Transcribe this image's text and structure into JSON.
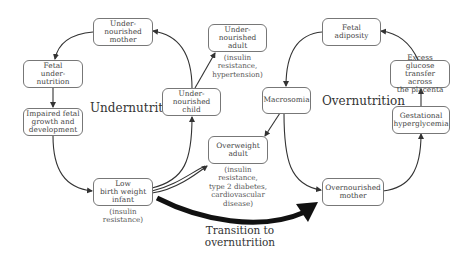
{
  "diagram": {
    "cycles": {
      "undernutrition": {
        "label": "Undernutrition"
      },
      "overnutrition": {
        "label": "Overnutrition"
      }
    },
    "transition": {
      "label": "Transition to\novernutrition"
    },
    "nodes": {
      "undernourished_mother": {
        "label": "Under-\nnourished\nmother"
      },
      "fetal_undernutrition": {
        "label": "Fetal\nunder-\nnutrition"
      },
      "impaired_growth": {
        "label": "Impaired fetal\ngrowth and\ndevelopment"
      },
      "low_birth_weight": {
        "label": "Low\nbirth weight\ninfant",
        "note": "(insulin\nresistance)"
      },
      "undernourished_child": {
        "label": "Under-\nnourished\nchild"
      },
      "undernourished_adult": {
        "label": "Under-\nnourished\nadult",
        "note": "(insulin\nresistance,\nhypertension)"
      },
      "overweight_adult": {
        "label": "Overweight\nadult",
        "note": "(insulin\nresistance,\ntype 2 diabetes,\ncardiovascular\ndisease)"
      },
      "macrosomia": {
        "label": "Macrosomia"
      },
      "fetal_adiposity": {
        "label": "Fetal\nadiposity"
      },
      "excess_glucose": {
        "label": "Excess glucose\ntransfer across\nthe placenta"
      },
      "gestational_hyperglycemia": {
        "label": "Gestational\nhyperglycemia"
      },
      "overnourished_mother": {
        "label": "Overnourished\nmother"
      }
    },
    "colors": {
      "line": "#333333",
      "box_border": "#777777",
      "text": "#444444"
    }
  }
}
